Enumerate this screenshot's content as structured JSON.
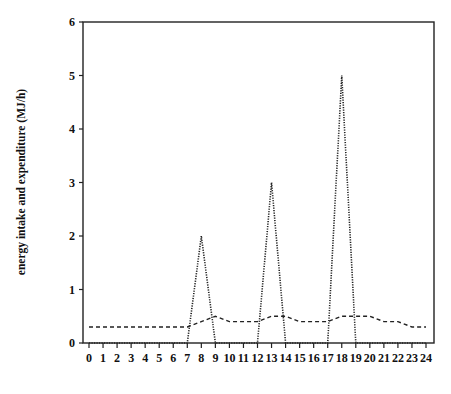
{
  "chart_data": {
    "type": "line",
    "title": "",
    "xlabel": "",
    "ylabel": "energy intake and expenditure (MJ/h)",
    "xlim": [
      0,
      24
    ],
    "ylim": [
      0,
      6
    ],
    "grid": false,
    "legend": null,
    "x": [
      0,
      1,
      2,
      3,
      4,
      5,
      6,
      7,
      8,
      9,
      10,
      11,
      12,
      13,
      14,
      15,
      16,
      17,
      18,
      19,
      20,
      21,
      22,
      23,
      24
    ],
    "x_tick_labels": [
      "0",
      "1",
      "2",
      "3",
      "4",
      "5",
      "6",
      "7",
      "8",
      "9",
      "10",
      "11",
      "12",
      "13",
      "14",
      "15",
      "16",
      "17",
      "18",
      "19",
      "20",
      "21",
      "22",
      "23",
      "24"
    ],
    "y_tick_labels": [
      "0",
      "1",
      "2",
      "3",
      "4",
      "5",
      "6"
    ],
    "series": [
      {
        "name": "energy intake",
        "style": "dotted",
        "values": [
          0,
          0,
          0,
          0,
          0,
          0,
          0,
          0,
          2,
          0,
          0,
          0,
          0,
          3,
          0,
          0,
          0,
          0,
          5,
          0,
          0,
          0,
          0,
          0,
          0
        ]
      },
      {
        "name": "energy expenditure",
        "style": "dashed",
        "values": [
          0.3,
          0.3,
          0.3,
          0.3,
          0.3,
          0.3,
          0.3,
          0.3,
          0.4,
          0.5,
          0.4,
          0.4,
          0.4,
          0.5,
          0.5,
          0.4,
          0.4,
          0.4,
          0.5,
          0.5,
          0.5,
          0.4,
          0.4,
          0.3,
          0.3
        ]
      }
    ]
  }
}
